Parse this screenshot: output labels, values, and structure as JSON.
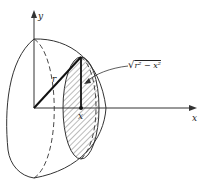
{
  "diagram": {
    "labels": {
      "y_axis": "y",
      "x_axis": "x",
      "radius": "r",
      "x_position": "x",
      "formula_radical": "√",
      "formula_body": "r² − x²"
    },
    "colors": {
      "stroke": "#333333",
      "background": "#ffffff"
    }
  }
}
